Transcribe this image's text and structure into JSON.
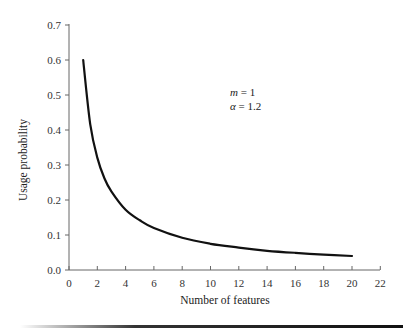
{
  "chart_data": {
    "type": "line",
    "title": "",
    "xlabel": "Number of features",
    "ylabel": "Usage probability",
    "xlim": [
      0,
      22
    ],
    "ylim": [
      0,
      0.7
    ],
    "x_ticks": [
      "0",
      "2",
      "4",
      "6",
      "8",
      "10",
      "12",
      "14",
      "16",
      "18",
      "20",
      "22"
    ],
    "y_ticks": [
      "0.0",
      "0.1",
      "0.2",
      "0.3",
      "0.4",
      "0.5",
      "0.6",
      "0.7"
    ],
    "grid": false,
    "legend": null,
    "annotations": [
      {
        "text_var": "m",
        "text_value": " = 1"
      },
      {
        "text_var": "α",
        "text_value": " = 1.2"
      }
    ],
    "series": [
      {
        "name": "usage probability",
        "color": "#111111",
        "x": [
          1,
          1.5,
          2,
          2.5,
          3,
          4,
          5,
          6,
          8,
          10,
          12,
          14,
          16,
          18,
          20
        ],
        "y": [
          0.6,
          0.417,
          0.321,
          0.262,
          0.224,
          0.172,
          0.142,
          0.12,
          0.092,
          0.075,
          0.064,
          0.055,
          0.049,
          0.044,
          0.04
        ]
      }
    ]
  },
  "annotation": {
    "m_var": "m",
    "m_val": " = 1",
    "alpha_var": "α",
    "alpha_val": " = 1.2"
  },
  "axes": {
    "xlabel": "Number of features",
    "ylabel": "Usage probability"
  }
}
